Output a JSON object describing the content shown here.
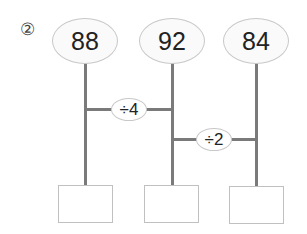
{
  "problem_number": "②",
  "top_numbers": [
    "88",
    "92",
    "84"
  ],
  "operations": [
    {
      "label": "÷4",
      "between": [
        "88",
        "92"
      ]
    },
    {
      "label": "÷2",
      "between": [
        "92",
        "84"
      ]
    }
  ],
  "answer_boxes": [
    "",
    "",
    ""
  ],
  "colors": {
    "line": "#7a7a7a",
    "ellipse_border": "#c8c8c8",
    "box_border": "#c0c0c0",
    "text": "#222222"
  }
}
